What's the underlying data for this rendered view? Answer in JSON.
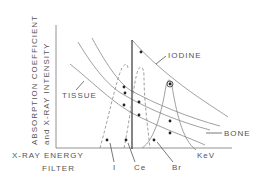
{
  "diagram": {
    "y_axis_label_line1": "ABSORPTION COEFFICIENT",
    "y_axis_label_line2": "and X-RAY INTENSITY",
    "x_axis_label": "X-RAY ENERGY",
    "x_axis_unit": "KeV",
    "filter_label": "FILTER",
    "curve_labels": {
      "iodine": "IODINE",
      "tissue": "TISSUE",
      "bone": "BONE"
    },
    "filter_labels": {
      "iodine": "I",
      "cerium": "Ce",
      "bromine": "Br"
    }
  }
}
